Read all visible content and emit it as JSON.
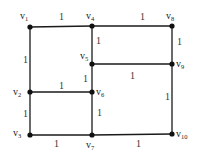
{
  "diagram": {
    "type": "weighted-undirected-graph",
    "vertices": [
      {
        "id": "v1",
        "base": "v",
        "sub": "1",
        "x": 30,
        "y": 27,
        "lx": 20,
        "ly": 19,
        "anchor": "start"
      },
      {
        "id": "v2",
        "base": "v",
        "sub": "2",
        "x": 30,
        "y": 92,
        "lx": 13,
        "ly": 95,
        "anchor": "start"
      },
      {
        "id": "v3",
        "base": "v",
        "sub": "3",
        "x": 30,
        "y": 135,
        "lx": 13,
        "ly": 136,
        "anchor": "start"
      },
      {
        "id": "v4",
        "base": "v",
        "sub": "4",
        "x": 92,
        "y": 26,
        "lx": 86,
        "ly": 19,
        "anchor": "start"
      },
      {
        "id": "v5",
        "base": "v",
        "sub": "5",
        "x": 92,
        "y": 64,
        "lx": 80,
        "ly": 59,
        "anchor": "start"
      },
      {
        "id": "v6",
        "base": "v",
        "sub": "6",
        "x": 92,
        "y": 92,
        "lx": 96,
        "ly": 95,
        "anchor": "start"
      },
      {
        "id": "v7",
        "base": "v",
        "sub": "7",
        "x": 92,
        "y": 135,
        "lx": 86,
        "ly": 148,
        "anchor": "start"
      },
      {
        "id": "v8",
        "base": "v",
        "sub": "8",
        "x": 172,
        "y": 26,
        "lx": 166,
        "ly": 19,
        "anchor": "start"
      },
      {
        "id": "v9",
        "base": "v",
        "sub": "9",
        "x": 172,
        "y": 64,
        "lx": 176,
        "ly": 67,
        "anchor": "start"
      },
      {
        "id": "v10",
        "base": "v",
        "sub": "10",
        "x": 172,
        "y": 134,
        "lx": 176,
        "ly": 137,
        "anchor": "start"
      }
    ],
    "edges": [
      {
        "from": "v1",
        "to": "v4",
        "weight": "1",
        "wx": 59,
        "wy": 20
      },
      {
        "from": "v4",
        "to": "v8",
        "weight": "1",
        "wx": 140,
        "wy": 20
      },
      {
        "from": "v1",
        "to": "v2",
        "weight": "1",
        "wx": 23,
        "wy": 63
      },
      {
        "from": "v2",
        "to": "v3",
        "weight": "1",
        "wx": 23,
        "wy": 117
      },
      {
        "from": "v4",
        "to": "v5",
        "weight": "1",
        "wx": 96,
        "wy": 44
      },
      {
        "from": "v5",
        "to": "v6",
        "weight": "1",
        "wx": 83,
        "wy": 82
      },
      {
        "from": "v6",
        "to": "v7",
        "weight": "1",
        "wx": 97,
        "wy": 116
      },
      {
        "from": "v8",
        "to": "v9",
        "weight": "1",
        "wx": 177,
        "wy": 45
      },
      {
        "from": "v9",
        "to": "v10",
        "weight": "1",
        "wx": 165,
        "wy": 100
      },
      {
        "from": "v5",
        "to": "v9",
        "weight": "1",
        "wx": 130,
        "wy": 79
      },
      {
        "from": "v2",
        "to": "v6",
        "weight": "1",
        "wx": 59,
        "wy": 89
      },
      {
        "from": "v3",
        "to": "v7",
        "weight": "1",
        "wx": 54,
        "wy": 147
      },
      {
        "from": "v7",
        "to": "v10",
        "weight": "1",
        "wx": 136,
        "wy": 147
      }
    ],
    "colors": {
      "edge": "#1a1a1a",
      "node": "#111111",
      "label": "#222222",
      "background": "#ffffff"
    }
  }
}
